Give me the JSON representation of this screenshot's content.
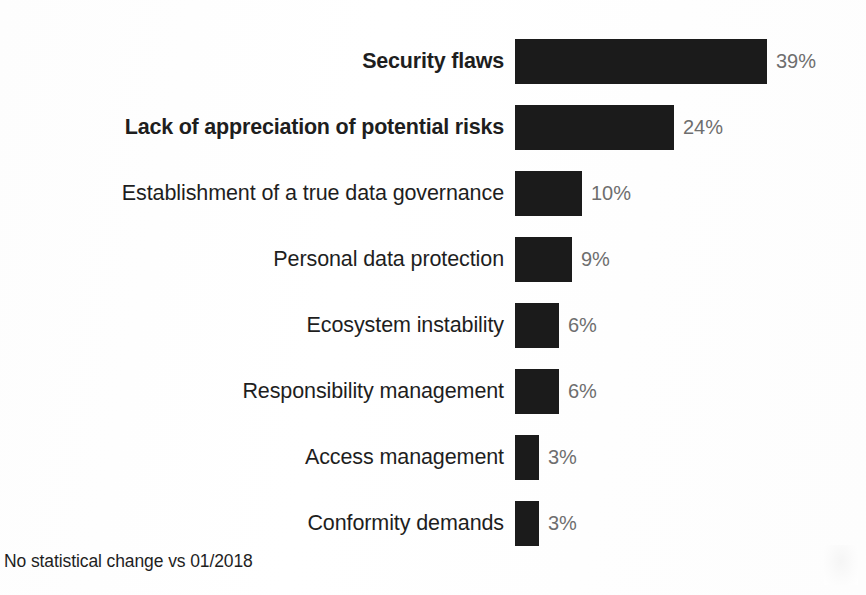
{
  "chart_data": {
    "type": "bar",
    "orientation": "horizontal",
    "title": "",
    "xlabel": "",
    "ylabel": "",
    "grid": false,
    "legend": null,
    "xlim": [
      0,
      39
    ],
    "value_suffix": "%",
    "categories": [
      "Security flaws",
      "Lack of appreciation of potential risks",
      "Establishment of a true data governance",
      "Personal data protection",
      "Ecosystem instability",
      "Responsibility management",
      "Access management",
      "Conformity demands"
    ],
    "values": [
      39,
      24,
      10,
      9,
      6,
      6,
      3,
      3
    ],
    "value_labels": [
      "39%",
      "24%",
      "10%",
      "9%",
      "6%",
      "6%",
      "3%",
      "3%"
    ],
    "emphasized": [
      true,
      true,
      false,
      false,
      false,
      false,
      false,
      false
    ],
    "bar_color": "#1b1b1b",
    "value_label_color": "#6e6e6e",
    "category_label_color": "#1e1e1e",
    "background_color": "#ffffff",
    "annotation": "No statistical change vs 01/2018"
  },
  "rows": [
    {
      "label": "Security flaws",
      "value_label": "39%",
      "bar_px": 252
    },
    {
      "label": "Lack of appreciation of potential risks",
      "value_label": "24%",
      "bar_px": 159
    },
    {
      "label": "Establishment of a true data governance",
      "value_label": "10%",
      "bar_px": 67
    },
    {
      "label": "Personal data protection",
      "value_label": "9%",
      "bar_px": 57
    },
    {
      "label": "Ecosystem instability",
      "value_label": "6%",
      "bar_px": 44
    },
    {
      "label": "Responsibility management",
      "value_label": "6%",
      "bar_px": 44
    },
    {
      "label": "Access management",
      "value_label": "3%",
      "bar_px": 24
    },
    {
      "label": "Conformity demands",
      "value_label": "3%",
      "bar_px": 24
    }
  ],
  "footnote": "No statistical change vs 01/2018"
}
